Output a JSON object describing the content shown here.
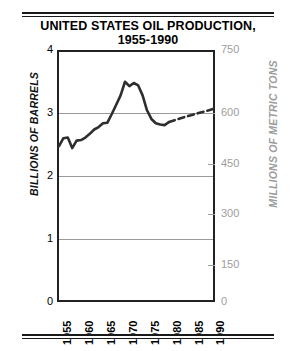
{
  "title": {
    "line1": "UNITED STATES OIL PRODUCTION,",
    "line2": "1955-1990"
  },
  "axes": {
    "left_title": "BILLIONS OF BARRELS",
    "right_title": "MILLIONS OF METRIC TONS",
    "left_ticks": [
      "4",
      "3",
      "2",
      "1",
      "0"
    ],
    "right_ticks": [
      "750",
      "600",
      "450",
      "300",
      "150",
      "0"
    ],
    "x_ticks": [
      "1955",
      "1960",
      "1965",
      "1970",
      "1975",
      "1980",
      "1985",
      "1990"
    ]
  },
  "colors": {
    "line": "#2e2e2e",
    "grid": "#9a9a9a",
    "frame": "#222222",
    "right_axis": "#9d9d9d",
    "text": "#000000"
  },
  "chart_data": {
    "type": "line",
    "title": "UNITED STATES OIL PRODUCTION, 1955-1990",
    "xlabel": "",
    "ylabel": "BILLIONS OF BARRELS",
    "y2label": "MILLIONS OF METRIC TONS",
    "xlim": [
      1955,
      1990
    ],
    "ylim": [
      0,
      4
    ],
    "y2lim": [
      0,
      750
    ],
    "grid": true,
    "gridlines_y": [
      1,
      2,
      3
    ],
    "legend": "none",
    "series": [
      {
        "name": "Actual production",
        "style": "solid",
        "x": [
          1955,
          1956,
          1957,
          1958,
          1959,
          1960,
          1961,
          1962,
          1963,
          1964,
          1965,
          1966,
          1967,
          1968,
          1969,
          1970,
          1971,
          1972,
          1973,
          1974,
          1975,
          1976,
          1977,
          1978,
          1979,
          1980
        ],
        "values": [
          2.48,
          2.61,
          2.62,
          2.45,
          2.57,
          2.58,
          2.62,
          2.68,
          2.75,
          2.79,
          2.85,
          2.86,
          3.0,
          3.15,
          3.3,
          3.52,
          3.45,
          3.5,
          3.46,
          3.3,
          3.06,
          2.92,
          2.85,
          2.83,
          2.82,
          2.87
        ]
      },
      {
        "name": "Projected production",
        "style": "dashed",
        "x": [
          1980,
          1983,
          1986,
          1990
        ],
        "values": [
          2.87,
          2.94,
          3.0,
          3.08
        ]
      }
    ]
  }
}
